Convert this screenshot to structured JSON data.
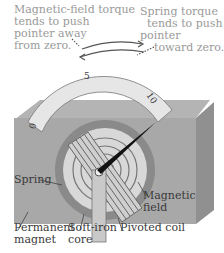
{
  "diagram": {
    "annotations": {
      "magnetic_torque": "Magnetic-field torque\ntends to push\npointer away\nfrom zero.",
      "spring_torque": "Spring torque\n  tends to push\npointer\n    toward zero."
    },
    "scale": {
      "tick_labels": [
        "0",
        "5",
        "10"
      ]
    },
    "parts": {
      "spring": "Spring",
      "magnetic_field": "Magnetic\nfield",
      "permanent_magnet": "Permanent\nmagnet",
      "soft_iron_core": "Soft-iron\ncore",
      "pivoted_coil": "Pivoted coil"
    },
    "colors": {
      "magnet_gray": "#a8a8a8",
      "magnet_side": "#8e8e8e",
      "scale_fill": "#e6e6e6",
      "pointer": "#111111",
      "annotation_text": "#9a9a9a",
      "label_text": "#3a3a3a"
    }
  }
}
